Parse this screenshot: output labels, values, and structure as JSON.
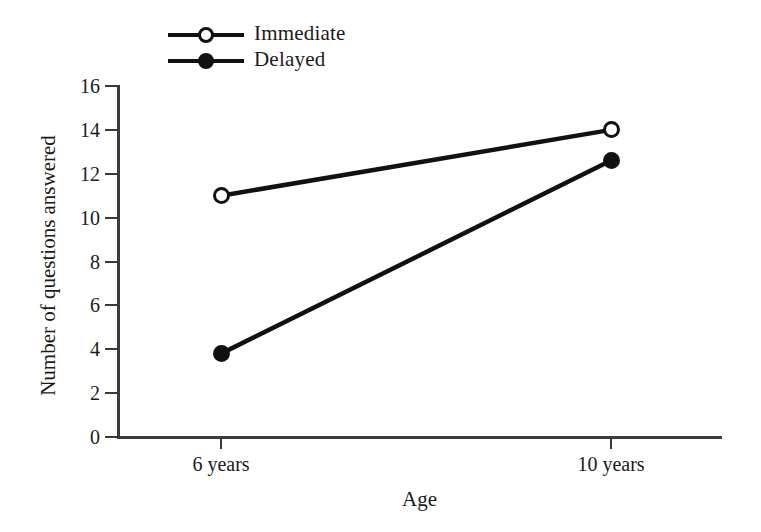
{
  "chart_data": {
    "type": "line",
    "title": "",
    "subtitle": "",
    "xlabel": "Age",
    "ylabel": "Number of questions answered",
    "categories": [
      "6 years",
      "10 years"
    ],
    "series": [
      {
        "name": "Immediate",
        "marker": "open-circle",
        "values": [
          11.0,
          14.0
        ]
      },
      {
        "name": "Delayed",
        "marker": "filled-circle",
        "values": [
          3.8,
          12.6
        ]
      }
    ],
    "ylim": [
      0,
      16
    ],
    "yticks": [
      0,
      2,
      4,
      6,
      8,
      10,
      12,
      14,
      16
    ],
    "ytick_labels": [
      "0",
      "2",
      "4",
      "6",
      "8",
      "10",
      "12",
      "14",
      "16"
    ],
    "xtick_labels": [
      "6 years",
      "10 years"
    ],
    "grid": false,
    "legend_position": "top-left",
    "line_color": "#111111",
    "axis_color": "#3a3a3a",
    "background": "#ffffff"
  },
  "legend": {
    "items": [
      {
        "label": "Immediate",
        "marker": "open-circle"
      },
      {
        "label": "Delayed",
        "marker": "filled-circle"
      }
    ]
  },
  "axes": {
    "y_title": "Number of questions answered",
    "x_title": "Age"
  }
}
